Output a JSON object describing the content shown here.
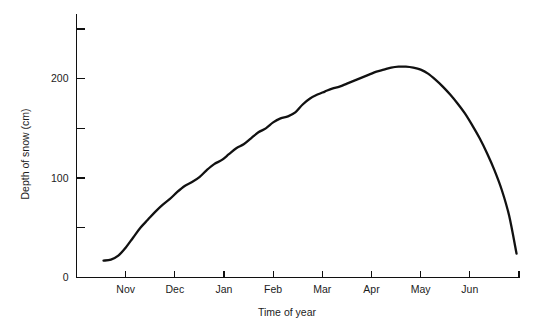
{
  "chart_data": {
    "type": "line",
    "title": "",
    "xlabel": "Time of year",
    "ylabel": "Depth of snow (cm)",
    "xlim": [
      0,
      9
    ],
    "ylim": [
      0,
      265
    ],
    "grid": false,
    "legend": "none",
    "x_tick_labels": [
      "Nov",
      "Dec",
      "Jan",
      "Feb",
      "Mar",
      "Apr",
      "May",
      "Jun",
      "",
      ""
    ],
    "x_tick_values": [
      1,
      2,
      3,
      4,
      5,
      6,
      7,
      8,
      9,
      10
    ],
    "y_tick_values": [
      0,
      50,
      100,
      150,
      200,
      250
    ],
    "y_tick_labels": [
      "0",
      "",
      "100",
      "",
      "200",
      ""
    ],
    "series": [
      {
        "name": "Depth of snow",
        "color": "#111111",
        "x": [
          0.55,
          0.7,
          0.85,
          1.0,
          1.15,
          1.3,
          1.45,
          1.6,
          1.75,
          1.9,
          2.05,
          2.2,
          2.35,
          2.5,
          2.65,
          2.8,
          2.95,
          3.1,
          3.25,
          3.4,
          3.55,
          3.7,
          3.85,
          4.0,
          4.15,
          4.3,
          4.45,
          4.6,
          4.75,
          4.9,
          5.05,
          5.2,
          5.35,
          5.5,
          5.65,
          5.8,
          5.95,
          6.1,
          6.25,
          6.4,
          6.55,
          6.7,
          6.85,
          7.0,
          7.15,
          7.3,
          7.45,
          7.6,
          7.75,
          7.9,
          8.05,
          8.2,
          8.35,
          8.5,
          8.65,
          8.8,
          8.95
        ],
        "y": [
          17,
          18,
          22,
          30,
          40,
          50,
          58,
          66,
          73,
          79,
          86,
          92,
          96,
          101,
          108,
          114,
          118,
          124,
          130,
          134,
          140,
          146,
          150,
          156,
          160,
          162,
          166,
          174,
          180,
          184,
          187,
          190,
          192,
          195,
          198,
          201,
          204,
          207,
          209,
          211,
          212,
          212,
          211,
          209,
          205,
          199,
          192,
          184,
          175,
          165,
          153,
          140,
          125,
          108,
          88,
          62,
          24
        ]
      }
    ],
    "annotations": []
  }
}
